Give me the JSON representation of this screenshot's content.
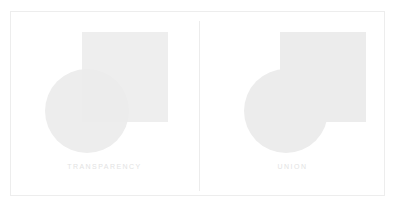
{
  "figure": {
    "background_color": "#ffffff",
    "frame_border_color": "#ededed",
    "divider_color": "#ececec",
    "label_color": "#e3e3e3"
  },
  "panels": [
    {
      "id": "transparency",
      "label": "TRANSPARENCY",
      "mode": "transparency",
      "description": "Square and circle drawn with partial opacity so the overlapping area appears darker",
      "shapes": {
        "square": {
          "name": "square",
          "x": 71,
          "y": 20,
          "width": 86,
          "height": 90,
          "fill": "#ebebeb",
          "opacity": 0.85
        },
        "circle": {
          "name": "circle",
          "cx": 76,
          "cy": 99,
          "r": 42,
          "fill": "#ededed",
          "opacity": 0.85
        },
        "overlap_fill": "#e1e1e1"
      }
    },
    {
      "id": "union",
      "label": "UNION",
      "mode": "union",
      "description": "Square and circle merged into a single flat shape with no darkened overlap",
      "shapes": {
        "square": {
          "name": "square",
          "x": 81,
          "y": 20,
          "width": 86,
          "height": 90,
          "fill": "#ececec",
          "opacity": 1
        },
        "circle": {
          "name": "circle",
          "cx": 87,
          "cy": 99,
          "r": 42,
          "fill": "#ececec",
          "opacity": 1
        },
        "overlap_fill": "#ececec"
      }
    }
  ]
}
